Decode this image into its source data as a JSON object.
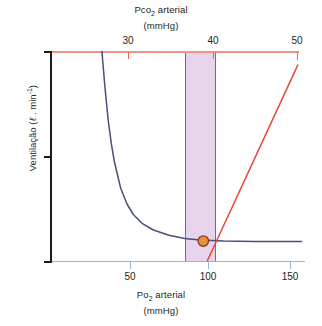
{
  "figure": {
    "top_axis_title_line1": "Pco",
    "top_axis_title_sub": "2",
    "top_axis_title_line1b": " arterial",
    "top_axis_title_line2": "(mmHg)",
    "bottom_axis_title_line1": "Po",
    "bottom_axis_title_sub": "2",
    "bottom_axis_title_line1b": " arterial",
    "bottom_axis_title_line2": "(mmHg)",
    "y_axis_title_pre": "Ventilação (",
    "y_axis_title_ell": "ℓ",
    "y_axis_title_mid": " . min",
    "y_axis_title_sup": "-1",
    "y_axis_title_post": ")",
    "bottom_caption": "cut-off caption text"
  },
  "colors": {
    "shaded_band": "#e7d4ea",
    "band_border": "#6b6b9e",
    "po2_curve": "#474f7a",
    "pco2_line": "#e8453c",
    "top_axis": "#f1928b",
    "bottom_axis": "#8fb8dd",
    "y_axis": "#1b1b1b",
    "marker_fill": "#e8913f",
    "marker_stroke": "#8a3c1e",
    "text": "#231f20"
  },
  "chart_data": {
    "type": "line",
    "xlabel": "Po2 arterial (mmHg)",
    "xlabel_top": "Pco2 arterial (mmHg)",
    "ylabel": "Ventilação (l . min-1)",
    "grid": false,
    "legend": "none",
    "ylim": [
      0,
      40
    ],
    "yticks": [
      0,
      20,
      40
    ],
    "ytick_labels": [
      "0",
      "20",
      "40"
    ],
    "xlim_bottom": [
      0,
      160
    ],
    "xticks_bottom": [
      50,
      100,
      150
    ],
    "xtick_labels_bottom": [
      "50",
      "100",
      "150"
    ],
    "xlim_top": [
      25,
      51
    ],
    "xticks_top": [
      30,
      40,
      50
    ],
    "xtick_labels_top": [
      "30",
      "40",
      "50"
    ],
    "shaded_region": {
      "label": "normal range",
      "x_start_po2": 85,
      "x_end_po2": 105,
      "x_start_pco2": 38.5,
      "x_end_pco2": 42.5
    },
    "series": [
      {
        "name": "Ventilação vs Po2 arterial (hyperbolic)",
        "color": "#474f7a",
        "axis": "bottom",
        "x": [
          32,
          34,
          36,
          38,
          40,
          44,
          48,
          52,
          58,
          65,
          75,
          85,
          95,
          110,
          130,
          160
        ],
        "y": [
          40,
          33,
          27,
          22.5,
          19,
          14,
          11,
          9,
          7.2,
          6.0,
          5.0,
          4.4,
          4.1,
          3.9,
          3.8,
          3.8
        ]
      },
      {
        "name": "Ventilação vs Pco2 arterial (linear)",
        "color": "#e8453c",
        "axis": "top",
        "x": [
          39.3,
          50
        ],
        "y": [
          0,
          37.5
        ]
      }
    ],
    "annotations": [
      {
        "type": "point-marker",
        "name": "normal-operating-point",
        "po2": 97,
        "pco2": 40,
        "ventilation": 3.9,
        "fill": "#e8913f",
        "stroke": "#8a3c1e"
      }
    ]
  }
}
